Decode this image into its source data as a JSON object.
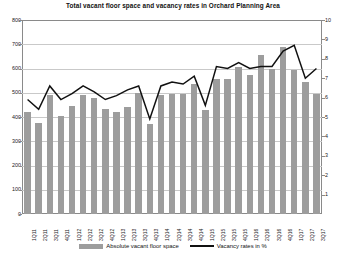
{
  "chart_data": {
    "type": "bar",
    "title": "Total vacant floor space and vacancy rates in Orchard Planning Area",
    "xlabel": "",
    "ylabel": "",
    "grid": true,
    "legend_position": "bottom",
    "categories": [
      "1Q11",
      "2Q11",
      "3Q11",
      "4Q11",
      "1Q12",
      "2Q12",
      "3Q12",
      "4Q12",
      "1Q13",
      "2Q13",
      "3Q13",
      "4Q13",
      "1Q14",
      "2Q14",
      "3Q14",
      "4Q14",
      "1Q15",
      "2Q15",
      "3Q15",
      "4Q15",
      "1Q16",
      "2Q16",
      "3Q16",
      "4Q16",
      "1Q17",
      "2Q17",
      "3Q17"
    ],
    "series": [
      {
        "name": "Absolute vacant floor space",
        "type": "bar",
        "axis": "left",
        "color": "#9d9d9d",
        "values": [
          420,
          375,
          490,
          405,
          445,
          490,
          480,
          435,
          420,
          440,
          500,
          370,
          490,
          495,
          495,
          535,
          430,
          555,
          555,
          605,
          575,
          655,
          600,
          690,
          595,
          545,
          495
        ]
      },
      {
        "name": "Vacancy rates in %",
        "type": "line",
        "axis": "right",
        "color": "#111111",
        "values": [
          5.9,
          5.4,
          6.6,
          5.9,
          6.2,
          6.6,
          6.3,
          5.9,
          6.1,
          6.4,
          6.6,
          4.9,
          6.6,
          6.8,
          6.7,
          7.1,
          5.6,
          7.6,
          7.5,
          7.8,
          7.5,
          7.6,
          7.6,
          8.4,
          8.7,
          7.0,
          7.5
        ]
      }
    ],
    "left_axis": {
      "ticks": [
        0,
        100,
        200,
        300,
        400,
        500,
        600,
        700,
        800
      ],
      "min": 0,
      "max": 800
    },
    "right_axis": {
      "ticks": [
        0,
        1,
        2,
        3,
        4,
        5,
        6,
        7,
        8,
        9,
        10
      ],
      "min": 0,
      "max": 10
    }
  },
  "legend": {
    "bars_label": "Absolute vacant floor space",
    "line_label": "Vacancy rates in %"
  },
  "colors": {
    "bar": "#9d9d9d",
    "line": "#111111",
    "grid": "#c9c9c9",
    "axis": "#8a8a8a"
  }
}
